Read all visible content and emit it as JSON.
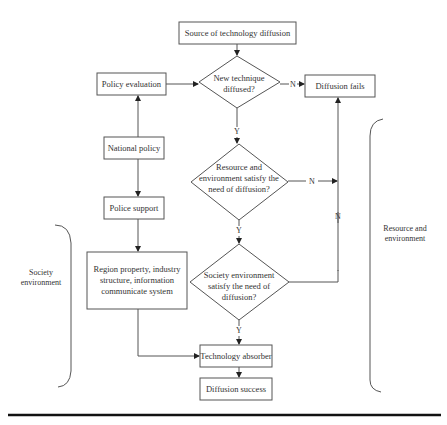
{
  "diagram": {
    "nodes": {
      "source": "Source of technology diffusion",
      "policy_eval": "Policy evaluation",
      "new_technique": [
        "New technique",
        "diffused?"
      ],
      "diffusion_fails": "Diffusion fails",
      "national_policy": "National policy",
      "resource_check": [
        "Resource and",
        "environment satisfy the",
        "need of diffusion?"
      ],
      "police_support": "Police support",
      "society_check": [
        "Society environment",
        "satisfy the need of",
        "diffusion?"
      ],
      "region_property": [
        "Region property, industry",
        "structure, information",
        "communicate system"
      ],
      "tech_absorber": "Technology absorber",
      "diffusion_success": "Diffusion success"
    },
    "edge_labels": {
      "yes": "Y",
      "no": "N"
    },
    "groups": {
      "society": [
        "Society",
        "environment"
      ],
      "resource": [
        "Resource and",
        "environment"
      ]
    }
  }
}
